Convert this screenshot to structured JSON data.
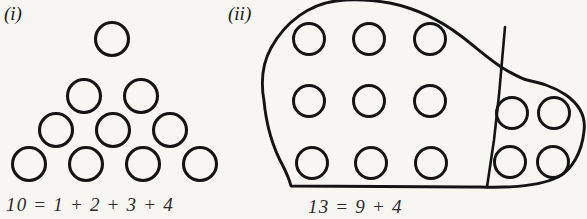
{
  "figure": {
    "background_color": "#f7f6f3",
    "ink_color": "#141417",
    "panels": [
      {
        "label": "(i)",
        "label_pos": {
          "x": 4,
          "y": 20
        },
        "caption": "10 = 1 + 2 + 3 + 4",
        "caption_pos": {
          "x": 6,
          "y": 211
        },
        "arrangement": "triangular-number-staircase",
        "total_dots": 10,
        "row_counts": [
          1,
          2,
          3,
          4
        ],
        "dot_radius": 16.5,
        "dots": [
          {
            "cx": 112,
            "cy": 39,
            "r": 16.5,
            "row": 1
          },
          {
            "cx": 84,
            "cy": 96,
            "r": 16.5,
            "row": 2
          },
          {
            "cx": 141,
            "cy": 96,
            "r": 16.5,
            "row": 2
          },
          {
            "cx": 56,
            "cy": 130,
            "r": 16.5,
            "row": 3
          },
          {
            "cx": 113,
            "cy": 130,
            "r": 16.5,
            "row": 3
          },
          {
            "cx": 170,
            "cy": 130,
            "r": 16.5,
            "row": 3
          },
          {
            "cx": 29,
            "cy": 164,
            "r": 16.5,
            "row": 4
          },
          {
            "cx": 86,
            "cy": 164,
            "r": 16.5,
            "row": 4
          },
          {
            "cx": 143,
            "cy": 164,
            "r": 16.5,
            "row": 4
          },
          {
            "cx": 200,
            "cy": 164,
            "r": 16.5,
            "row": 4
          }
        ]
      },
      {
        "label": "(ii)",
        "label_pos": {
          "x": 228,
          "y": 20
        },
        "caption": "13 = 9 + 4",
        "caption_pos": {
          "x": 308,
          "y": 213
        },
        "arrangement": "blob-partitioned-into-square-and-remainder",
        "total_dots": 13,
        "partition_counts": [
          9,
          4
        ],
        "blob_path": "M 336 1 C 310 4 285 22 271 48 C 261 66 261 84 264 101 C 266 122 272 146 283 166 C 288 176 290 182 291 186 L 470 187 L 480 187 C 510 188 540 186 558 177 C 572 170 582 152 584 131 C 586 116 580 105 566 95 C 553 86 540 83 527 80 C 520 78 513 74 506 70 C 492 62 477 48 461 36 C 440 20 414 8 390 3 C 372 0 352 -1 336 1 Z",
        "divider_path": "M 505 27 L 499 95 L 494 140 L 487 187",
        "left_group": {
          "count": 9,
          "grid": "3x3",
          "dot_radius": 15.5,
          "dots": [
            {
              "cx": 309,
              "cy": 39,
              "r": 15.5,
              "row": 1,
              "col": 1
            },
            {
              "cx": 369,
              "cy": 39,
              "r": 15.5,
              "row": 1,
              "col": 2
            },
            {
              "cx": 430,
              "cy": 39,
              "r": 15.5,
              "row": 1,
              "col": 3
            },
            {
              "cx": 309,
              "cy": 101,
              "r": 15.5,
              "row": 2,
              "col": 1
            },
            {
              "cx": 369,
              "cy": 101,
              "r": 15.5,
              "row": 2,
              "col": 2
            },
            {
              "cx": 430,
              "cy": 101,
              "r": 15.5,
              "row": 2,
              "col": 3
            },
            {
              "cx": 312,
              "cy": 163,
              "r": 15.5,
              "row": 3,
              "col": 1
            },
            {
              "cx": 371,
              "cy": 163,
              "r": 15.5,
              "row": 3,
              "col": 2
            },
            {
              "cx": 431,
              "cy": 163,
              "r": 15.5,
              "row": 3,
              "col": 3
            }
          ]
        },
        "right_group": {
          "count": 4,
          "grid": "2x2",
          "dot_radius": 15.5,
          "dots": [
            {
              "cx": 512,
              "cy": 113,
              "r": 15.5,
              "row": 1,
              "col": 1
            },
            {
              "cx": 554,
              "cy": 113,
              "r": 15.5,
              "row": 1,
              "col": 2
            },
            {
              "cx": 510,
              "cy": 162,
              "r": 15.5,
              "row": 2,
              "col": 1
            },
            {
              "cx": 553,
              "cy": 162,
              "r": 15.5,
              "row": 2,
              "col": 2
            }
          ]
        }
      }
    ]
  }
}
